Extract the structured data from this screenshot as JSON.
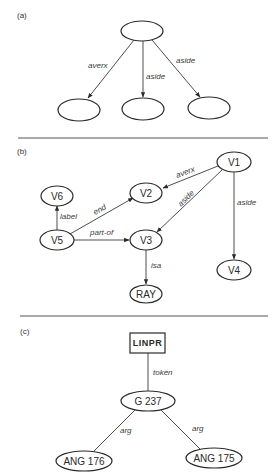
{
  "panels": {
    "a": {
      "label": "(a)",
      "nodes": {
        "top": "",
        "left": "",
        "middle": "",
        "right": ""
      },
      "edges": {
        "top_left": "averx",
        "top_middle": "aside",
        "top_right": "aside"
      }
    },
    "b": {
      "label": "(b)",
      "nodes": {
        "v1": "V1",
        "v2": "V2",
        "v3": "V3",
        "v4": "V4",
        "v5": "V5",
        "v6": "V6",
        "ray": "RAY"
      },
      "edges": {
        "v1_v2": "averx",
        "v1_v3": "aside",
        "v1_v4": "aside",
        "v5_v6": "label",
        "v5_v2": "end",
        "v5_v3": "part-of",
        "v3_ray": "isa"
      }
    },
    "c": {
      "label": "(c)",
      "nodes": {
        "linpr": "LINPR",
        "g237": "G 237",
        "ang176": "ANG 176",
        "ang175": "ANG 175"
      },
      "edges": {
        "linpr_g237": "token",
        "g237_ang176": "arg",
        "g237_ang175": "arg"
      }
    }
  },
  "colors": {
    "ink": "#2a2a2a",
    "background": "#ffffff"
  }
}
